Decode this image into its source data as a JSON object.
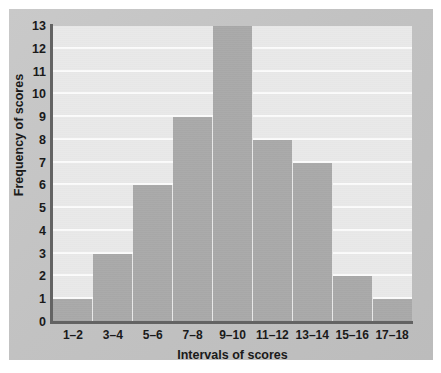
{
  "chart_data": {
    "type": "bar",
    "title": "",
    "xlabel": "Intervals of scores",
    "ylabel": "Frequency of scores",
    "categories": [
      "1–2",
      "3–4",
      "5–6",
      "7–8",
      "9–10",
      "11–12",
      "13–14",
      "15–16",
      "17–18"
    ],
    "values": [
      1,
      3,
      6,
      9,
      13,
      8,
      7,
      2,
      1
    ],
    "ylim": [
      0,
      13
    ],
    "yticks": [
      0,
      1,
      2,
      3,
      4,
      5,
      6,
      7,
      8,
      9,
      10,
      11,
      12,
      13
    ],
    "ytick_labels": [
      "0",
      "1",
      "2",
      "3",
      "4",
      "5",
      "6",
      "7",
      "8",
      "9",
      "10",
      "11",
      "12",
      "13"
    ],
    "grid": "horizontal",
    "legend": null,
    "colors": {
      "bar_fill": "#a9a9a9",
      "plot_background": "#e9e9e9",
      "gridline": "#fbfbfb",
      "axis_line": "#636363",
      "frame_background": "#c4c4c4",
      "text": "#1a1a1a"
    }
  }
}
